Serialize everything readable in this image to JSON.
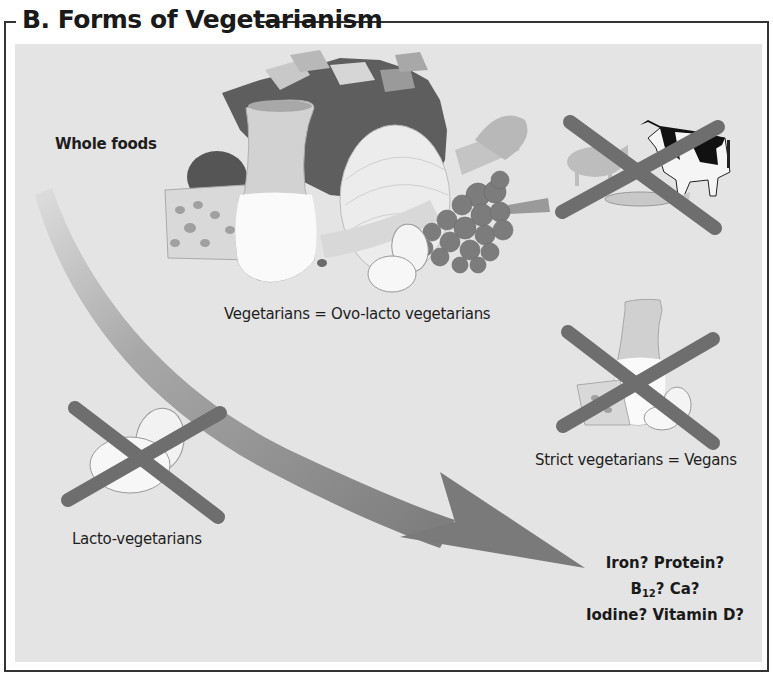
{
  "figure": {
    "title": "B. Forms of Vegetarianism",
    "panel_background": "#e4e4e4",
    "cross_color": "#6e6e6e",
    "arrow_color": "#8a8a8a"
  },
  "labels": {
    "whole_foods": "Whole foods",
    "ovo_lacto": "Vegetarians = Ovo-lacto vegetarians",
    "vegans": "Strict vegetarians = Vegans",
    "lacto": "Lacto-vegetarians"
  },
  "deficiencies": {
    "line1": "Iron?  Protein?",
    "line2_prefix": "B",
    "line2_sub": "12",
    "line2_suffix": "?  Ca?",
    "line3": "Iodine?  Vitamin D?"
  },
  "groups": [
    {
      "name": "Ovo-lacto vegetarians",
      "foods": [
        "cheese",
        "milk",
        "eggs",
        "bread",
        "vegetables",
        "grapes",
        "celery",
        "avocado",
        "onion"
      ],
      "excluded": [
        "meat",
        "fish"
      ]
    },
    {
      "name": "Lacto-vegetarians",
      "excluded": [
        "eggs",
        "meat",
        "fish"
      ]
    },
    {
      "name": "Vegans",
      "excluded": [
        "milk",
        "cheese",
        "eggs",
        "meat",
        "fish"
      ]
    }
  ],
  "icons": [
    "meat-animals-icon",
    "pig-icon",
    "cow-icon",
    "fish-icon",
    "dairy-icon",
    "egg-icon",
    "food-cluster-icon",
    "curved-arrow-icon",
    "cross-icon"
  ]
}
